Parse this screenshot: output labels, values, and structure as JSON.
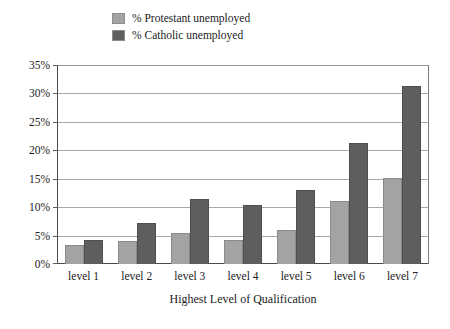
{
  "chart_data": {
    "type": "bar",
    "title": "",
    "subtitle": "",
    "xlabel": "Highest Level of Qualification",
    "ylabel": "",
    "categories": [
      "level 1",
      "level 2",
      "level 3",
      "level 4",
      "level 5",
      "level 6",
      "level 7"
    ],
    "series": [
      {
        "name": "% Protestant unemployed",
        "color": "#a3a3a3",
        "values": [
          3.3,
          4.0,
          5.4,
          4.3,
          6.0,
          11.0,
          15.2
        ]
      },
      {
        "name": "% Catholic unemployed",
        "color": "#5e5e5e",
        "values": [
          4.3,
          7.3,
          11.5,
          10.4,
          13.0,
          21.2,
          31.3
        ]
      }
    ],
    "ylim": [
      0,
      35
    ],
    "ytick_values": [
      0,
      5,
      10,
      15,
      20,
      25,
      30,
      35
    ],
    "ytick_labels": [
      "0%",
      "5%",
      "10%",
      "15%",
      "20%",
      "25%",
      "30%",
      "35%"
    ],
    "grid": true,
    "legend_position": "top-center",
    "annotations": []
  },
  "legend": {
    "items": [
      {
        "label": "% Protestant unemployed",
        "swatch": "#a3a3a3"
      },
      {
        "label": "% Catholic unemployed",
        "swatch": "#5e5e5e"
      }
    ]
  },
  "axes": {
    "x_title": "Highest Level of Qualification"
  }
}
